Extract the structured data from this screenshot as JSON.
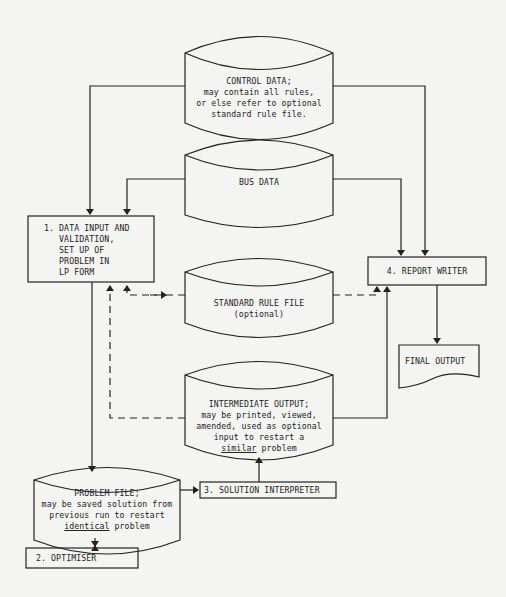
{
  "nodes": {
    "control_data": {
      "title": "CONTROL DATA;",
      "lines": [
        "may contain all rules,",
        "or else refer to optional",
        "standard rule file."
      ]
    },
    "bus_data": {
      "title": "BUS DATA"
    },
    "data_input": {
      "lines": [
        "1. DATA INPUT AND",
        "   VALIDATION,",
        "   SET UP OF",
        "   PROBLEM IN",
        "   LP FORM"
      ]
    },
    "report_writer": {
      "label": "4. REPORT WRITER"
    },
    "standard_rule_file": {
      "title": "STANDARD RULE FILE",
      "subtitle": "(optional)"
    },
    "final_output": {
      "label": "FINAL OUTPUT"
    },
    "intermediate_output": {
      "title": "INTERMEDIATE OUTPUT;",
      "lines": [
        "may be printed, viewed,",
        "amended, used as optional",
        "input to restart a"
      ],
      "last_underlined": "similar",
      "last_rest": " problem"
    },
    "problem_file": {
      "title": "PROBLEM FILE;",
      "lines": [
        "may be saved solution from",
        "previous run to restart"
      ],
      "last_underlined": "identical",
      "last_rest": " problem"
    },
    "solution_interpreter": {
      "label": "3. SOLUTION INTERPRETER"
    },
    "optimiser": {
      "label": "2. OPTIMISER"
    }
  },
  "colors": {
    "line": "#222222",
    "background": "#f4f4f2"
  }
}
